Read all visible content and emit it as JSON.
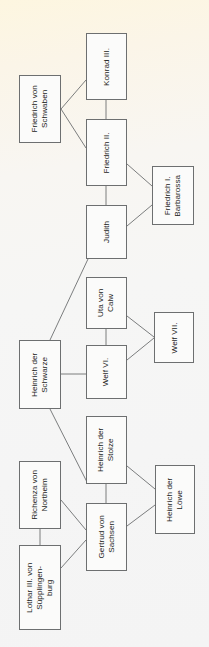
{
  "diagram": {
    "orientation": "rotated-90-ccw",
    "background_top_color": "#fdf6e0",
    "background_bottom_color": "#f4f4f4",
    "node_fill_color": "#fbfbfa",
    "node_border_color": "#6d6f70",
    "edge_color": "#6d6f70",
    "nodes": [
      {
        "id": "friedrich-von-schwaben",
        "label": "Friedrich von\nSchwaben",
        "x": 19,
        "y": 75,
        "w": 42,
        "h": 68
      },
      {
        "id": "konrad-iii",
        "label": "Konrad III.",
        "x": 86,
        "y": 33,
        "w": 41,
        "h": 67
      },
      {
        "id": "friedrich-ii",
        "label": "Friedrich II.",
        "x": 86,
        "y": 119,
        "w": 41,
        "h": 67
      },
      {
        "id": "friedrich-i-barbarossa",
        "label": "Friedrich I.\nBarbarossa",
        "x": 152,
        "y": 166,
        "w": 42,
        "h": 59
      },
      {
        "id": "judith",
        "label": "Judith",
        "x": 86,
        "y": 205,
        "w": 41,
        "h": 54
      },
      {
        "id": "uta-von-calw",
        "label": "Uta von\nCalw",
        "x": 86,
        "y": 277,
        "w": 41,
        "h": 52
      },
      {
        "id": "welf-vii",
        "label": "Welf VII.",
        "x": 154,
        "y": 312,
        "w": 40,
        "h": 51
      },
      {
        "id": "welf-vi",
        "label": "Welf VI.",
        "x": 86,
        "y": 345,
        "w": 41,
        "h": 54
      },
      {
        "id": "heinrich-der-schwarze",
        "label": "Heinrich der\nSchwarze",
        "x": 19,
        "y": 340,
        "w": 42,
        "h": 69
      },
      {
        "id": "heinrich-der-stolze",
        "label": "Heinrich der\nStolze",
        "x": 86,
        "y": 416,
        "w": 41,
        "h": 68
      },
      {
        "id": "heinrich-der-loewe",
        "label": "Heinrich der\nLöwe",
        "x": 155,
        "y": 465,
        "w": 40,
        "h": 69
      },
      {
        "id": "gertrud-von-sachsen",
        "label": "Gertrud von\nSachsen",
        "x": 86,
        "y": 503,
        "w": 41,
        "h": 68
      },
      {
        "id": "richenza-von-northeim",
        "label": "Richenza von\nNortheim",
        "x": 19,
        "y": 461,
        "w": 42,
        "h": 68
      },
      {
        "id": "lothar-iii-suepplingenburg",
        "label": "Lothar III. von\nSüpplingen-\nburg",
        "x": 19,
        "y": 545,
        "w": 42,
        "h": 85
      }
    ],
    "edges": [
      {
        "id": "edge-schwaben-konrad",
        "from": "friedrich-von-schwaben",
        "to": "konrad-iii",
        "x1": 61,
        "y1": 109,
        "x2": 86,
        "y2": 80,
        "kind": "diagonal"
      },
      {
        "id": "edge-schwaben-friedrich2",
        "from": "friedrich-von-schwaben",
        "to": "friedrich-ii",
        "x1": 61,
        "y1": 109,
        "x2": 86,
        "y2": 148,
        "kind": "diagonal"
      },
      {
        "id": "edge-konrad-friedrich2",
        "from": "konrad-iii",
        "to": "friedrich-ii",
        "x1": 106,
        "y1": 100,
        "x2": 106,
        "y2": 119,
        "kind": "vertical"
      },
      {
        "id": "edge-friedrich2-barbarossa",
        "from": "friedrich-ii",
        "to": "friedrich-i-barbarossa",
        "x1": 127,
        "y1": 164,
        "x2": 152,
        "y2": 186,
        "kind": "diagonal"
      },
      {
        "id": "edge-friedrich2-judith",
        "from": "friedrich-ii",
        "to": "judith",
        "x1": 106,
        "y1": 186,
        "x2": 106,
        "y2": 205,
        "kind": "vertical"
      },
      {
        "id": "edge-judith-barbarossa",
        "from": "judith",
        "to": "friedrich-i-barbarossa",
        "x1": 127,
        "y1": 226,
        "x2": 152,
        "y2": 205,
        "kind": "diagonal"
      },
      {
        "id": "edge-schwarze-judith",
        "from": "heinrich-der-schwarze",
        "to": "judith",
        "x1": 50,
        "y1": 340,
        "x2": 88,
        "y2": 259,
        "kind": "diagonal"
      },
      {
        "id": "edge-uta-welf7",
        "from": "uta-von-calw",
        "to": "welf-vii",
        "x1": 127,
        "y1": 316,
        "x2": 154,
        "y2": 337,
        "kind": "diagonal"
      },
      {
        "id": "edge-uta-welf6",
        "from": "uta-von-calw",
        "to": "welf-vi",
        "x1": 106,
        "y1": 329,
        "x2": 106,
        "y2": 345,
        "kind": "vertical"
      },
      {
        "id": "edge-welf6-welf7",
        "from": "welf-vi",
        "to": "welf-vii",
        "x1": 127,
        "y1": 360,
        "x2": 154,
        "y2": 338,
        "kind": "diagonal"
      },
      {
        "id": "edge-schwarze-welf6",
        "from": "heinrich-der-schwarze",
        "to": "welf-vi",
        "x1": 61,
        "y1": 374,
        "x2": 86,
        "y2": 374,
        "kind": "horizontal"
      },
      {
        "id": "edge-schwarze-stolze",
        "from": "heinrich-der-schwarze",
        "to": "heinrich-der-stolze",
        "x1": 50,
        "y1": 409,
        "x2": 88,
        "y2": 484,
        "kind": "diagonal"
      },
      {
        "id": "edge-stolze-loewe",
        "from": "heinrich-der-stolze",
        "to": "heinrich-der-loewe",
        "x1": 127,
        "y1": 466,
        "x2": 155,
        "y2": 489,
        "kind": "diagonal"
      },
      {
        "id": "edge-stolze-gertrud",
        "from": "heinrich-der-stolze",
        "to": "gertrud-von-sachsen",
        "x1": 106,
        "y1": 484,
        "x2": 106,
        "y2": 503,
        "kind": "vertical"
      },
      {
        "id": "edge-gertrud-loewe",
        "from": "gertrud-von-sachsen",
        "to": "heinrich-der-loewe",
        "x1": 127,
        "y1": 526,
        "x2": 155,
        "y2": 505,
        "kind": "diagonal"
      },
      {
        "id": "edge-richenza-gertrud",
        "from": "richenza-von-northeim",
        "to": "gertrud-von-sachsen",
        "x1": 61,
        "y1": 500,
        "x2": 86,
        "y2": 530,
        "kind": "diagonal"
      },
      {
        "id": "edge-lothar-gertrud",
        "from": "lothar-iii-suepplingenburg",
        "to": "gertrud-von-sachsen",
        "x1": 61,
        "y1": 568,
        "x2": 86,
        "y2": 540,
        "kind": "diagonal"
      },
      {
        "id": "edge-richenza-lothar",
        "from": "richenza-von-northeim",
        "to": "lothar-iii-suepplingenburg",
        "x1": 40,
        "y1": 529,
        "x2": 40,
        "y2": 545,
        "kind": "vertical"
      }
    ]
  }
}
